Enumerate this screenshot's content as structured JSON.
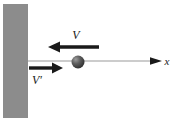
{
  "figure": {
    "background_color": "#ffffff",
    "width": 178,
    "height": 124
  },
  "wall": {
    "name": "wall",
    "fill_color": "#8c8c8c",
    "x": 3,
    "y": 4,
    "width": 25,
    "height": 114
  },
  "axis": {
    "label": "x",
    "line_color": "#9a9a9a",
    "arrow_color": "#1a1a1a",
    "y": 61,
    "x_start": 28,
    "x_end": 162,
    "label_x": 167,
    "label_y": 65
  },
  "ball": {
    "name": "ball",
    "fill_color": "#4a4a4a",
    "highlight_color": "#9c9c9c",
    "center_x": 78,
    "center_y": 62,
    "radius": 6.5
  },
  "incoming_velocity": {
    "label": "V",
    "direction": "left",
    "color": "#1a1a1a",
    "y": 47,
    "tail_x": 99,
    "tip_x": 48,
    "label_x": 76,
    "label_y": 39
  },
  "outgoing_velocity": {
    "label": "V′",
    "direction": "right",
    "color": "#1a1a1a",
    "y": 68,
    "tail_x": 29,
    "tip_x": 63,
    "label_x": 37,
    "label_y": 84
  }
}
